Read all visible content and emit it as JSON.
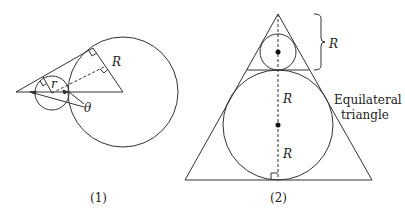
{
  "figure1": {
    "caption": "(1)",
    "labels": {
      "big_radius": "R",
      "small_radius": "r",
      "angle": "θ"
    }
  },
  "figure2": {
    "caption": "(2)",
    "labels": {
      "brace": "R",
      "upper_segment": "R",
      "lower_segment": "R"
    },
    "annotation_line1": "Equilateral",
    "annotation_line2": "triangle"
  },
  "colors": {
    "stroke": "#333333",
    "background": "#ffffff"
  }
}
